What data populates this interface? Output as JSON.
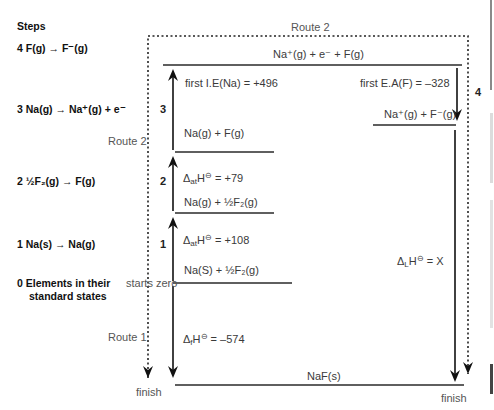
{
  "steps_header": "Steps",
  "steps": [
    {
      "num": "4",
      "text": "F(g) → F⁻(g)"
    },
    {
      "num": "3",
      "text": "Na(g) → Na⁺(g) + e⁻"
    },
    {
      "num": "2",
      "text": "½F₂(g) → F(g)"
    },
    {
      "num": "1",
      "text": "Na(s) → Na(g)"
    },
    {
      "num": "0",
      "text": "Elements in their",
      "text2": "standard states"
    }
  ],
  "routes": {
    "route1": "Route 1",
    "route2_top": "Route 2",
    "route2_left": "Route 2",
    "starts_zero": "starts zero",
    "finish_left": "finish",
    "finish_right": "finish"
  },
  "levels": {
    "top": "Na⁺(g) + e⁻ + F(g)",
    "ions": "Na⁺(g) + F⁻(g)",
    "na_g_f_g": "Na(g) + F(g)",
    "na_g_half_f2": "Na(g) + ½F₂(g)",
    "elements": "Na(S) + ½F₂(g)",
    "product": "NaF(s)"
  },
  "enthalpies": {
    "ie": "first I.E(Na) = +496",
    "ea": "first E.A(F) = –328",
    "at_f_prefix": "Δ",
    "at_f_sub": "at",
    "at_f_suffix": "H",
    "at_f_value": " = +79",
    "at_na_prefix": "Δ",
    "at_na_sub": "at",
    "at_na_suffix": "H",
    "at_na_value": " = +108",
    "f_prefix": "Δ",
    "f_sub": "f",
    "f_suffix": "H",
    "f_value": " = –574",
    "l_prefix": "Δ",
    "l_sub": "L",
    "l_suffix": "H",
    "l_value": " = X",
    "standard_symbol": "⊖"
  },
  "step_markers": {
    "s1": "1",
    "s2": "2",
    "s3": "3",
    "s4": "4"
  },
  "colors": {
    "line": "#2a2a2a",
    "text": "#3a3a3a"
  }
}
